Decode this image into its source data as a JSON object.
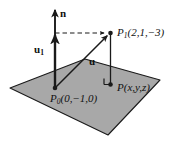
{
  "figure": {
    "type": "3d-vector-diagram",
    "colors": {
      "plane_fill": "#a8a8a8",
      "plane_stroke": "#1a1a1a",
      "line": "#1a1a1a",
      "background": "#ffffff",
      "label": "#111111"
    },
    "plane": {
      "name": "plane-parallelogram",
      "vertices": [
        [
          10,
          88
        ],
        [
          85,
          59
        ],
        [
          160,
          80
        ],
        [
          108,
          135
        ]
      ]
    },
    "points": [
      {
        "id": "P0",
        "label_main": "P",
        "label_sub": "0",
        "label_rest": "(0,−1,0)",
        "label_full": "P₀(0,−1,0)",
        "coords": [
          0,
          -1,
          0
        ],
        "pixel": [
          55,
          88
        ]
      },
      {
        "id": "P1",
        "label_main": "P",
        "label_sub": "1",
        "label_rest": "(2,1,−3)",
        "label_full": "P₁(2,1,−3)",
        "coords": [
          2,
          1,
          -3
        ],
        "pixel": [
          110,
          33
        ]
      },
      {
        "id": "P",
        "label_main": "P",
        "label_sub": "",
        "label_rest": "(x,y,z)",
        "label_full": "P(x,y,z)",
        "coords": [
          "x",
          "y",
          "z"
        ],
        "pixel": [
          110,
          84
        ]
      }
    ],
    "vectors": [
      {
        "id": "n",
        "label_main": "n",
        "label_sub": "",
        "label_full": "n",
        "role": "normal-vector",
        "from": [
          55,
          88
        ],
        "to": [
          55,
          8
        ]
      },
      {
        "id": "u1",
        "label_main": "u",
        "label_sub": "1",
        "label_full": "u₁",
        "role": "projection-vector",
        "from": [
          55,
          88
        ],
        "to": [
          55,
          33
        ]
      },
      {
        "id": "u",
        "label_main": "u",
        "label_sub": "",
        "label_full": "u",
        "role": "position-vector",
        "from": [
          55,
          88
        ],
        "to": [
          110,
          33
        ]
      }
    ],
    "dashed_line": {
      "name": "dashed-projection-line",
      "from": [
        55,
        33
      ],
      "to": [
        110,
        33
      ]
    },
    "drop_line": {
      "name": "vertical-drop-line",
      "from": [
        110,
        33
      ],
      "to": [
        110,
        84
      ]
    },
    "right_angle": {
      "name": "right-angle-marker",
      "at": [
        110,
        84
      ],
      "size": 6
    }
  }
}
